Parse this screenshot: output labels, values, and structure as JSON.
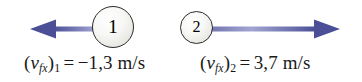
{
  "figure": {
    "background_color": "#ffffff",
    "width": 362,
    "height": 82,
    "arrow_color_dark": "#4a4f96",
    "arrow_color_light": "#9a9dcc",
    "circle_outline_color": "#2b2b2b",
    "text_color": "#1a1a1a"
  },
  "particles": [
    {
      "id": "particle-1",
      "digit": "1",
      "arrow_direction": "left",
      "label": {
        "open_paren": "(",
        "symbol": "v",
        "symbol_subscript": "fx",
        "close_paren": ")",
        "index_subscript": "1",
        "equals": "=",
        "value": "−1,3",
        "unit": "m/s",
        "full_text": "(vfx)₁ = −1,3 m/s"
      }
    },
    {
      "id": "particle-2",
      "digit": "2",
      "arrow_direction": "right",
      "label": {
        "open_paren": "(",
        "symbol": "v",
        "symbol_subscript": "fx",
        "close_paren": ")",
        "index_subscript": "2",
        "equals": "=",
        "value": "3,7",
        "unit": "m/s",
        "full_text": "(vfx)₂ = 3,7 m/s"
      }
    }
  ],
  "icons": {
    "left_arrow": "arrow-left-icon",
    "right_arrow": "arrow-right-icon"
  }
}
